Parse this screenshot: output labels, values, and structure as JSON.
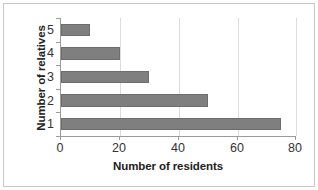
{
  "chart_data": {
    "type": "bar",
    "orientation": "horizontal",
    "title": "",
    "xlabel": "Number of residents",
    "ylabel": "Number of relatives",
    "categories": [
      "1",
      "2",
      "3",
      "4",
      "5"
    ],
    "values": [
      75,
      50,
      30,
      20,
      10
    ],
    "display_order_top_to_bottom": [
      "5",
      "4",
      "3",
      "2",
      "1"
    ],
    "xlim": [
      0,
      80
    ],
    "xticks": [
      "0",
      "20",
      "40",
      "60",
      "80"
    ],
    "xtick_values": [
      0,
      20,
      40,
      60,
      80
    ],
    "yticks": [
      "5",
      "4",
      "3",
      "2",
      "1"
    ],
    "grid": "vertical",
    "legend": "none",
    "bar_color": "#7f7f7f",
    "bar_edge_color": "#6d6d6d",
    "gridline_color": "#dcdcdc",
    "axis_color": "#9a9a9a",
    "series": [
      {
        "name": "Number of residents",
        "points": [
          {
            "category": "5",
            "value": 10
          },
          {
            "category": "4",
            "value": 20
          },
          {
            "category": "3",
            "value": 30
          },
          {
            "category": "2",
            "value": 50
          },
          {
            "category": "1",
            "value": 75
          }
        ]
      }
    ]
  }
}
